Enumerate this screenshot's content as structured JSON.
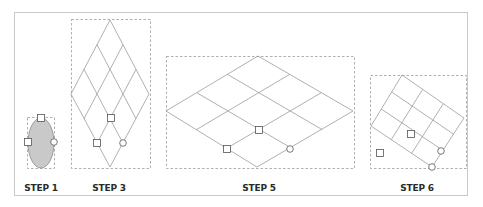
{
  "colors": {
    "frame": "#c8c8c8",
    "dashed_box": "#9a9a9a",
    "grid_line": "#9c9c9c",
    "ellipse_fill": "#c9c9c9",
    "ellipse_stroke": "#8a8a8a",
    "handle_stroke": "#555555",
    "label": "#2a2a2a"
  },
  "steps": [
    {
      "id": "step1",
      "label": "STEP 1",
      "label_x": 41
    },
    {
      "id": "step3",
      "label": "STEP 3",
      "label_x": 109
    },
    {
      "id": "step5",
      "label": "STEP 5",
      "label_x": 259
    },
    {
      "id": "step6",
      "label": "STEP 6",
      "label_x": 417
    }
  ]
}
